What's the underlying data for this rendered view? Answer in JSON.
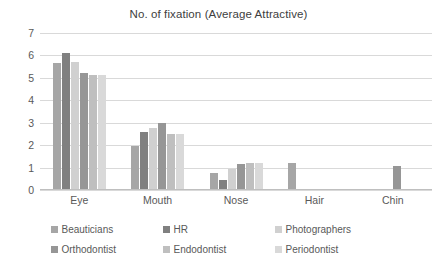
{
  "chart_data": {
    "type": "bar",
    "title": "No. of fixation (Average Attractive)",
    "xlabel": "",
    "ylabel": "",
    "ylim": [
      0,
      7
    ],
    "yticks": [
      0,
      1,
      2,
      3,
      4,
      5,
      6,
      7
    ],
    "grid": true,
    "legend_position": "bottom",
    "categories": [
      "Eye",
      "Mouth",
      "Nose",
      "Hair",
      "Chin"
    ],
    "series": [
      {
        "name": "Beauticians",
        "color": "#a6a6a6",
        "values": [
          5.65,
          1.95,
          0.75,
          1.2,
          0.05
        ]
      },
      {
        "name": "HR",
        "color": "#808080",
        "values": [
          6.1,
          2.6,
          0.45,
          0,
          0
        ]
      },
      {
        "name": "Photographers",
        "color": "#d0d0d0",
        "values": [
          5.7,
          2.75,
          0.95,
          0,
          0
        ]
      },
      {
        "name": "Orthodontist",
        "color": "#969696",
        "values": [
          5.2,
          3.0,
          1.15,
          0,
          1.05
        ]
      },
      {
        "name": "Endodontist",
        "color": "#bfbfbf",
        "values": [
          5.15,
          2.5,
          1.2,
          0,
          0
        ]
      },
      {
        "name": "Periodontist",
        "color": "#d9d9d9",
        "values": [
          5.15,
          2.5,
          1.2,
          0,
          0
        ]
      }
    ]
  },
  "legend": {
    "rows": [
      [
        "Beauticians",
        "HR",
        "Photographers"
      ],
      [
        "Orthodontist",
        "Endodontist",
        "Periodontist"
      ]
    ]
  }
}
